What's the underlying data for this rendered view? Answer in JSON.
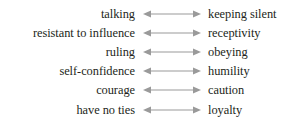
{
  "diagram": {
    "background_color": "#ffffff",
    "text_color": "#231f20",
    "arrow_color": "#9a9a9a",
    "arrow_icon_name": "double-headed-arrow-icon",
    "rows": [
      {
        "left": "talking",
        "right": "keeping silent"
      },
      {
        "left": "resistant to influence",
        "right": "receptivity"
      },
      {
        "left": "ruling",
        "right": "obeying"
      },
      {
        "left": "self-confidence",
        "right": "humility"
      },
      {
        "left": "courage",
        "right": "caution"
      },
      {
        "left": "have no ties",
        "right": "loyalty"
      }
    ]
  }
}
